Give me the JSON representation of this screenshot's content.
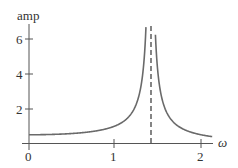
{
  "chart_data": {
    "type": "line",
    "title": "",
    "xlabel": "ω",
    "ylabel": "amp",
    "xlim": [
      0,
      2.15
    ],
    "ylim": [
      0,
      6.8
    ],
    "x_ticks": [
      0,
      1,
      2
    ],
    "x_tick_labels": [
      "0",
      "1",
      "2"
    ],
    "y_ticks": [
      2,
      4,
      6
    ],
    "y_tick_labels": [
      "2",
      "4",
      "6"
    ],
    "grid": false,
    "legend": null,
    "series": [
      {
        "name": "amplitude response",
        "formula": "1/|2 - ω^2|",
        "x": [
          0,
          0.25,
          0.5,
          0.75,
          1.0,
          1.1,
          1.2,
          1.3,
          1.35,
          1.38,
          1.45,
          1.48,
          1.55,
          1.6,
          1.7,
          1.8,
          1.9,
          2.0,
          2.1
        ],
        "values": [
          0.5,
          0.52,
          0.57,
          0.7,
          1.0,
          1.26,
          1.79,
          3.2,
          5.4,
          6.8,
          9.8,
          5.3,
          2.5,
          1.8,
          1.12,
          0.81,
          0.62,
          0.5,
          0.41
        ],
        "color": "#666666"
      }
    ],
    "annotations": [
      {
        "type": "vertical-dashed-line",
        "x": 1.414,
        "label": "resonance asymptote ω=√2"
      }
    ]
  },
  "labels": {
    "ylabel": "amp",
    "xlabel": "ω",
    "x0": "0",
    "x1": "1",
    "x2": "2",
    "y2": "2",
    "y4": "4",
    "y6": "6"
  }
}
